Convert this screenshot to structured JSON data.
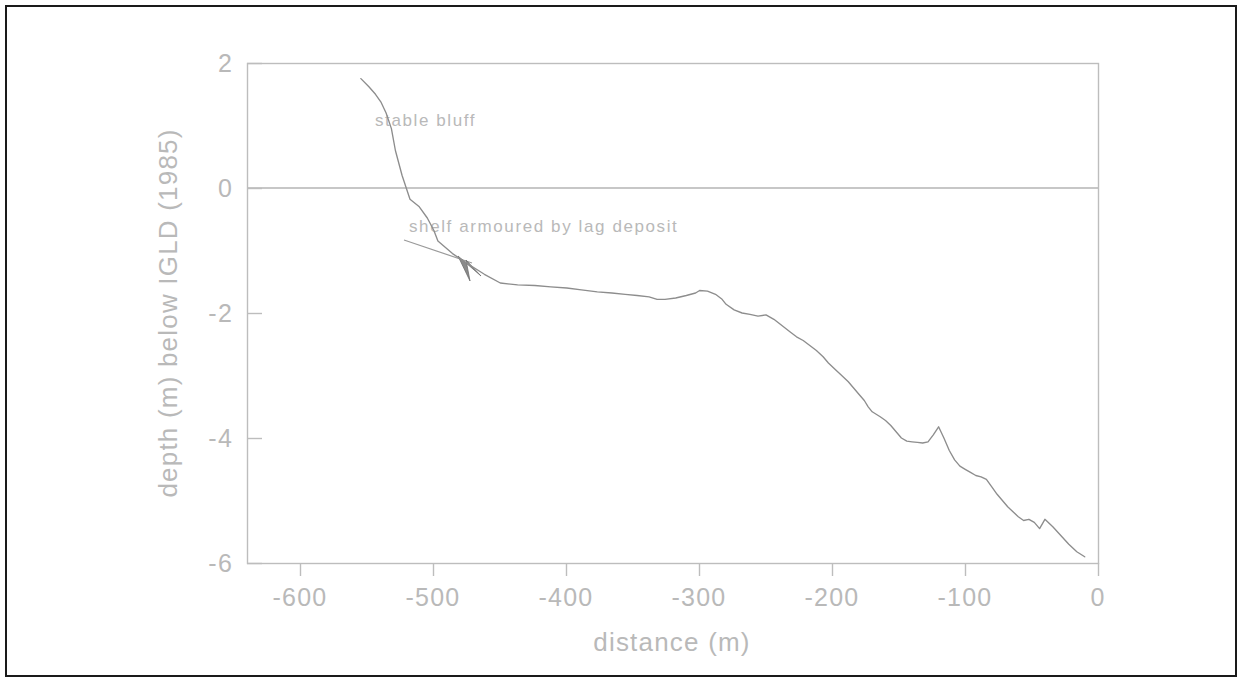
{
  "figure": {
    "background_color": "#ffffff",
    "border_color": "#1a1a1a",
    "axis_color": "#bdbdbd",
    "line_color": "#8d8d8d",
    "text_color": "#b9b9b9"
  },
  "chart_data": {
    "type": "line",
    "title": "",
    "subtitle": "",
    "xlabel": "distance (m)",
    "ylabel": "depth (m) below IGLD (1985)",
    "xlim": [
      -640,
      0
    ],
    "ylim": [
      -6,
      2
    ],
    "xticks": [
      -600,
      -500,
      -400,
      -300,
      -200,
      -100,
      0
    ],
    "xticklabels": [
      "-600",
      "-500",
      "-400",
      "-300",
      "-200",
      "-100",
      "0"
    ],
    "yticks": [
      2,
      0,
      -2,
      -4,
      -6
    ],
    "yticklabels": [
      "2",
      "0",
      "-2",
      "-4",
      "-6"
    ],
    "grid": false,
    "legend": null,
    "reference_lines": [
      {
        "name": "water-level-igld-datum",
        "axis": "y",
        "value": 0
      }
    ],
    "series": [
      {
        "name": "nearshore profile",
        "x": [
          -555,
          -549,
          -544,
          -540,
          -536,
          -532,
          -529,
          -524,
          -518,
          -511,
          -505,
          -500,
          -497,
          -486,
          -474,
          -462,
          -450,
          -437,
          -424,
          -412,
          -400,
          -389,
          -377,
          -366,
          -356,
          -347,
          -338,
          -332,
          -326,
          -318,
          -310,
          -303,
          -300,
          -294,
          -288,
          -283,
          -280,
          -274,
          -268,
          -262,
          -256,
          -250,
          -244,
          -238,
          -232,
          -227,
          -222,
          -217,
          -212,
          -207,
          -203,
          -198,
          -193,
          -188,
          -184,
          -180,
          -176,
          -173,
          -170,
          -167,
          -164,
          -160,
          -156,
          -152,
          -148,
          -144,
          -140,
          -136,
          -132,
          -128,
          -124,
          -120,
          -116,
          -112,
          -108,
          -104,
          -100,
          -96,
          -92,
          -88,
          -84,
          -80,
          -76,
          -72,
          -68,
          -64,
          -60,
          -56,
          -52,
          -48,
          -44,
          -40,
          -34,
          -28,
          -22,
          -16,
          -10
        ],
        "y": [
          1.75,
          1.62,
          1.5,
          1.38,
          1.2,
          0.95,
          0.6,
          0.2,
          -0.18,
          -0.3,
          -0.48,
          -0.68,
          -0.85,
          -1.05,
          -1.22,
          -1.38,
          -1.52,
          -1.55,
          -1.56,
          -1.58,
          -1.6,
          -1.63,
          -1.66,
          -1.68,
          -1.7,
          -1.72,
          -1.74,
          -1.78,
          -1.78,
          -1.76,
          -1.72,
          -1.68,
          -1.64,
          -1.65,
          -1.7,
          -1.78,
          -1.86,
          -1.95,
          -2.0,
          -2.02,
          -2.05,
          -2.03,
          -2.1,
          -2.2,
          -2.3,
          -2.38,
          -2.44,
          -2.52,
          -2.6,
          -2.7,
          -2.8,
          -2.9,
          -3.0,
          -3.1,
          -3.2,
          -3.3,
          -3.4,
          -3.5,
          -3.58,
          -3.62,
          -3.66,
          -3.72,
          -3.8,
          -3.9,
          -4.0,
          -4.05,
          -4.06,
          -4.07,
          -4.08,
          -4.06,
          -3.95,
          -3.82,
          -4.0,
          -4.2,
          -4.35,
          -4.45,
          -4.5,
          -4.55,
          -4.6,
          -4.62,
          -4.66,
          -4.78,
          -4.9,
          -5.0,
          -5.1,
          -5.18,
          -5.26,
          -5.32,
          -5.3,
          -5.35,
          -5.45,
          -5.3,
          -5.42,
          -5.56,
          -5.7,
          -5.82,
          -5.9
        ],
        "color": "#8d8d8d"
      }
    ],
    "annotations": [
      {
        "name": "stable-bluff-label",
        "text": "stable bluff",
        "x": -585,
        "y": 1.05,
        "arrow": false
      },
      {
        "name": "shelf-armour-label",
        "text": "shelf armoured by lag deposit",
        "x": -515,
        "y": -0.78,
        "arrow": true,
        "arrow_tip_x": -552,
        "arrow_tip_y": -1.35
      }
    ]
  }
}
